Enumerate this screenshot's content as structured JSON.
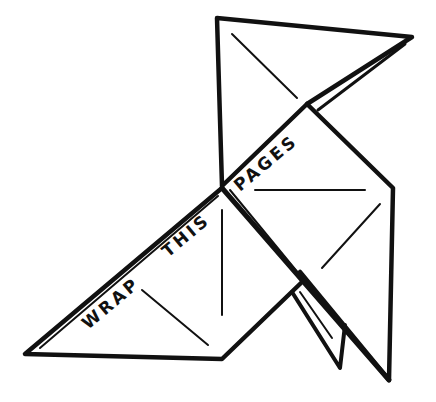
{
  "illustration": {
    "subject": "origami bird line drawing",
    "stroke_color": "#111111",
    "background_color": "#ffffff",
    "text": {
      "word1": "WRAP",
      "word2": "THIS",
      "word3": "PAGES"
    }
  }
}
